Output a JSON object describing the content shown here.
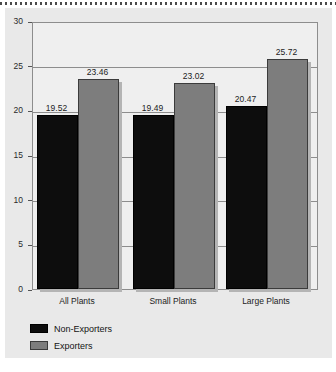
{
  "chart_data": {
    "type": "bar",
    "title": "",
    "subtitle": "",
    "xlabel": "",
    "ylabel": "",
    "categories": [
      "All Plants",
      "Small Plants",
      "Large Plants"
    ],
    "series": [
      {
        "name": "Non-Exporters",
        "color": "#0d0d0d",
        "values": [
          19.52,
          19.49,
          20.47
        ]
      },
      {
        "name": "Exporters",
        "color": "#7d7d7d",
        "values": [
          23.46,
          23.02,
          25.72
        ]
      }
    ],
    "value_labels": [
      [
        "19.52",
        "19.49",
        "20.47"
      ],
      [
        "23.46",
        "23.02",
        "25.72"
      ]
    ],
    "ylim": [
      0,
      30
    ],
    "ytick_values": [
      0,
      5,
      10,
      15,
      20,
      25,
      30
    ],
    "ytick_labels": [
      "0",
      "5",
      "10",
      "15",
      "20",
      "25",
      "30"
    ],
    "grid": true,
    "grid_axis": "y",
    "legend_position": "below-left",
    "legend_entries": [
      "Non-Exporters",
      "Exporters"
    ]
  },
  "figure": {
    "card_background": "#e9e9e9",
    "plot_background": "#efefef",
    "axis_color": "#8d8d8d"
  }
}
